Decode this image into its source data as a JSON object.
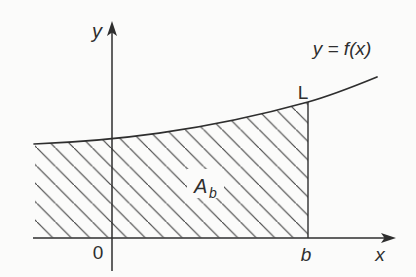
{
  "figure": {
    "type": "math-diagram",
    "colors": {
      "background": "#fbfbfa",
      "ink": "#2e2e2e",
      "hatch": "#474747"
    },
    "axis_labels": {
      "y": "y",
      "x": "x"
    },
    "origin_label": "0",
    "b_tick_label": "b",
    "curve_label": "y = f(x)",
    "point_label": "L",
    "area_label": {
      "base": "A",
      "subscript": "b"
    }
  }
}
